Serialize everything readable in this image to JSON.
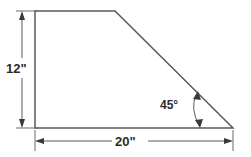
{
  "figure": {
    "background_color": "#ffffff",
    "line_color": "#5a5a5a",
    "text_color": "#2b2b2b",
    "shape": {
      "name": "trapezoid",
      "vertices": [
        {
          "label": "top-left",
          "x": 35,
          "y": 11
        },
        {
          "label": "top-right",
          "x": 115,
          "y": 11
        },
        {
          "label": "bottom-right",
          "x": 233,
          "y": 128
        },
        {
          "label": "bottom-left",
          "x": 35,
          "y": 128
        }
      ]
    },
    "dimensions": [
      {
        "id": "height",
        "label": "12\"",
        "value": 12,
        "unit": "inches",
        "orientation": "vertical",
        "position": "left"
      },
      {
        "id": "width",
        "label": "20\"",
        "value": 20,
        "unit": "inches",
        "orientation": "horizontal",
        "position": "bottom"
      }
    ],
    "angles": [
      {
        "id": "bottom-right-angle",
        "label": "45°",
        "value": 45,
        "unit": "degrees",
        "vertex": "bottom-right"
      }
    ]
  }
}
